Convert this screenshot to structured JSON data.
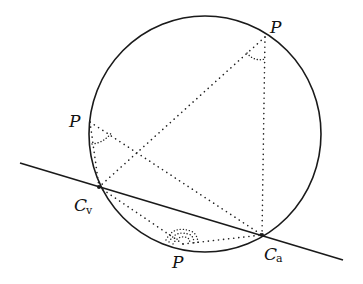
{
  "diagram": {
    "type": "geometry",
    "labels": {
      "p_top": "P",
      "p_left": "P",
      "p_bottom": "P",
      "cv_main": "C",
      "cv_sub": "v",
      "ca_main": "C",
      "ca_sub": "a"
    },
    "colors": {
      "stroke": "#1a1a1a",
      "background": "#ffffff"
    }
  }
}
